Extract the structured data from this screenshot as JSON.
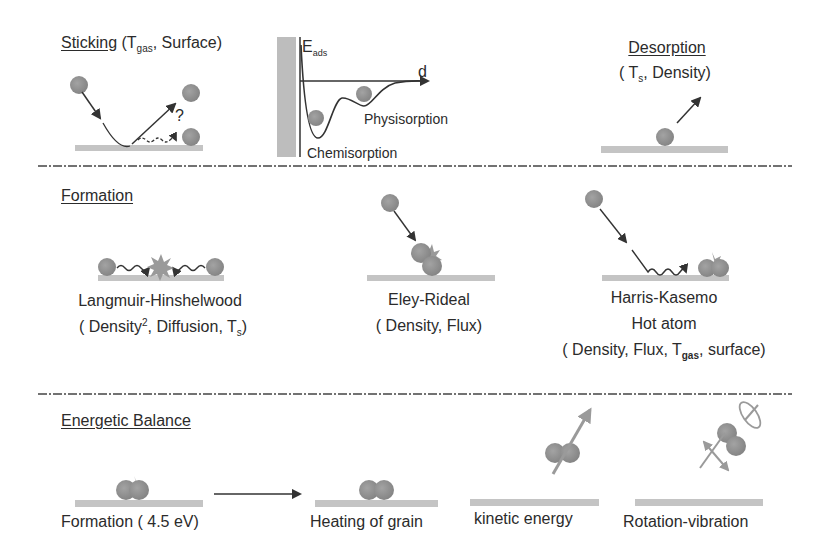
{
  "colors": {
    "particle": "#8f8f8f",
    "particle_dark": "#7a7a7a",
    "surface": "#c4c4c4",
    "wall": "#bdbdbd",
    "line": "#333333",
    "text": "#2b2b2b",
    "separator": "#444444",
    "light_arrow": "#9a9a9a"
  },
  "sticking": {
    "title": "Sticking",
    "params_prefix": " (T",
    "params_sub": "gas",
    "params_suffix": ", Surface)",
    "question_mark": "?"
  },
  "potential": {
    "y_label": "E",
    "y_label_sub": "ads",
    "x_label": "d",
    "physisorption_label": "Physisorption",
    "chemisorption_label": "Chemisorption"
  },
  "desorption": {
    "title": "Desorption",
    "params_prefix": "( T",
    "params_sub": "s",
    "params_suffix": ", Density)"
  },
  "formation": {
    "title": "Formation",
    "mechanisms": [
      {
        "name": "Langmuir-Hinshelwood",
        "params_a": "( Density",
        "params_sup": "2",
        "params_b": ", Diffusion, T",
        "params_sub": "s",
        "params_c": ")"
      },
      {
        "name": "Eley-Rideal",
        "params": "( Density, Flux)"
      },
      {
        "name": "Harris-Kasemo",
        "name_line2": "Hot atom",
        "params_a": "( Density, Flux, T",
        "params_sub": "gas",
        "params_b": ", surface)"
      }
    ]
  },
  "energetic_balance": {
    "title": "Energetic Balance",
    "items": [
      {
        "label": "Formation ( 4.5 eV)"
      },
      {
        "label": "Heating of grain"
      },
      {
        "label": "kinetic energy"
      },
      {
        "label": "Rotation-vibration"
      }
    ]
  }
}
